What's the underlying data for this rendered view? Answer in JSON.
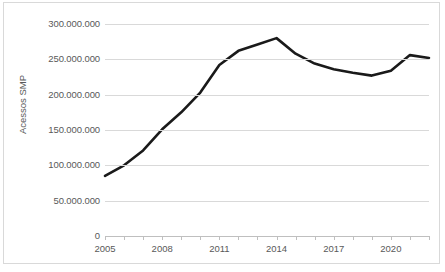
{
  "chart_data": {
    "type": "line",
    "title": "",
    "xlabel": "",
    "ylabel": "Acessos SMP",
    "xlim": [
      2005,
      2022
    ],
    "ylim": [
      0,
      300000000
    ],
    "grid": true,
    "legend": "none",
    "line_color": "#1a1a1a",
    "gridline_color": "#d9d9d9",
    "tick_label_color": "#595959",
    "border_color": "#d9d9d9",
    "x": [
      2005,
      2006,
      2007,
      2008,
      2009,
      2010,
      2011,
      2012,
      2013,
      2014,
      2015,
      2016,
      2017,
      2018,
      2019,
      2020,
      2021,
      2022
    ],
    "values": [
      85000000,
      100000000,
      121000000,
      151000000,
      175000000,
      203000000,
      242000000,
      262000000,
      271000000,
      280000000,
      258000000,
      244000000,
      236000000,
      231000000,
      227000000,
      234000000,
      256000000,
      252000000
    ],
    "series": [
      {
        "name": "Acessos SMP",
        "values": [
          85000000,
          100000000,
          121000000,
          151000000,
          175000000,
          203000000,
          242000000,
          262000000,
          271000000,
          280000000,
          258000000,
          244000000,
          236000000,
          231000000,
          227000000,
          234000000,
          256000000,
          252000000
        ]
      }
    ],
    "ytick_values": [
      0,
      50000000,
      100000000,
      150000000,
      200000000,
      250000000,
      300000000
    ],
    "ytick_labels": [
      "0",
      "50.000.000",
      "100.000.000",
      "150.000.000",
      "200.000.000",
      "250.000.000",
      "300.000.000"
    ],
    "xtick_values": [
      2005,
      2008,
      2011,
      2014,
      2017,
      2020
    ],
    "xtick_labels": [
      "2005",
      "2008",
      "2011",
      "2014",
      "2017",
      "2020"
    ],
    "xtick_minor_values": [
      2005,
      2006,
      2007,
      2008,
      2009,
      2010,
      2011,
      2012,
      2013,
      2014,
      2015,
      2016,
      2017,
      2018,
      2019,
      2020,
      2021,
      2022
    ]
  }
}
